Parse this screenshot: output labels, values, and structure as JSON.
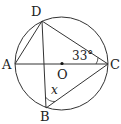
{
  "diagram": {
    "type": "circle-geometry",
    "circle": {
      "center": "O"
    },
    "points": {
      "A": {
        "label": "A"
      },
      "B": {
        "label": "B"
      },
      "C": {
        "label": "C"
      },
      "D": {
        "label": "D"
      },
      "O": {
        "label": "O"
      }
    },
    "segments": [
      "AC",
      "AD",
      "DC",
      "DB",
      "BC"
    ],
    "angles": {
      "DCA": {
        "label": "33°"
      },
      "DBC": {
        "label": "x"
      }
    }
  }
}
